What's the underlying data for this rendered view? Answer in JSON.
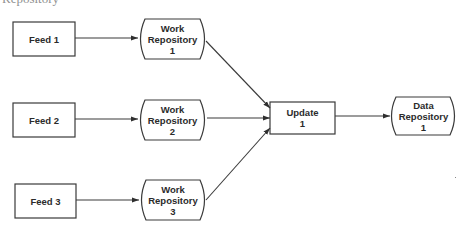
{
  "diagram": {
    "cropped_caption": "Repository",
    "colors": {
      "stroke": "#3a3a3a",
      "text": "#2b2b2b",
      "background": "#ffffff"
    },
    "nodes": {
      "feed1": {
        "shape": "rectangle",
        "lines": [
          "Feed 1"
        ]
      },
      "feed2": {
        "shape": "rectangle",
        "lines": [
          "Feed 2"
        ]
      },
      "feed3": {
        "shape": "rectangle",
        "lines": [
          "Feed 3"
        ]
      },
      "work_repo1": {
        "shape": "stored-data",
        "lines": [
          "Work",
          "Repository",
          "1"
        ]
      },
      "work_repo2": {
        "shape": "stored-data",
        "lines": [
          "Work",
          "Repository",
          "2"
        ]
      },
      "work_repo3": {
        "shape": "stored-data",
        "lines": [
          "Work",
          "Repository",
          "3"
        ]
      },
      "update1": {
        "shape": "rectangle",
        "lines": [
          "Update",
          "1"
        ]
      },
      "data_repo1": {
        "shape": "stored-data",
        "lines": [
          "Data",
          "Repository",
          "1"
        ]
      }
    },
    "edges": [
      {
        "from": "Feed 1",
        "to": "Work Repository 1"
      },
      {
        "from": "Feed 2",
        "to": "Work Repository 2"
      },
      {
        "from": "Feed 3",
        "to": "Work Repository 3"
      },
      {
        "from": "Work Repository 1",
        "to": "Update 1"
      },
      {
        "from": "Work Repository 2",
        "to": "Update 1"
      },
      {
        "from": "Work Repository 3",
        "to": "Update 1"
      },
      {
        "from": "Update 1",
        "to": "Data Repository 1"
      }
    ]
  }
}
